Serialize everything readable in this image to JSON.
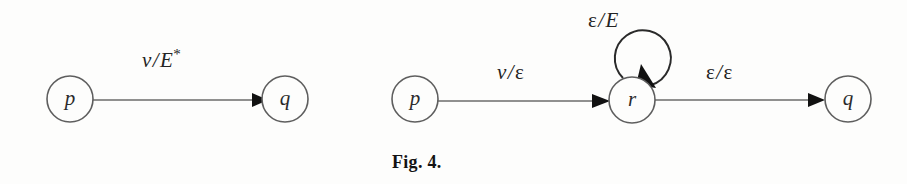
{
  "figure": {
    "caption": "Fig. 4.",
    "background_color": "#fdfdfc",
    "stroke_color": "#5e5e5e",
    "arrow_color": "#111111",
    "text_color": "#232323"
  },
  "diagrams": [
    {
      "name": "left-automaton",
      "nodes": [
        {
          "id": "p",
          "label": "p",
          "cx": 70,
          "cy": 99,
          "r": 23
        },
        {
          "id": "q",
          "label": "q",
          "cx": 285,
          "cy": 99,
          "r": 23
        }
      ],
      "edges": [
        {
          "from": "p",
          "to": "q",
          "label_input": "v",
          "label_separator": "/",
          "label_output": "E",
          "label_output_superscript": "*",
          "label_text": "v/E*",
          "label_x": 142,
          "label_y": 48
        }
      ]
    },
    {
      "name": "right-automaton",
      "nodes": [
        {
          "id": "p",
          "label": "p",
          "cx": 415,
          "cy": 99,
          "r": 23
        },
        {
          "id": "r",
          "label": "r",
          "cx": 632,
          "cy": 100,
          "r": 23
        },
        {
          "id": "q",
          "label": "q",
          "cx": 848,
          "cy": 99,
          "r": 23
        }
      ],
      "edges": [
        {
          "from": "p",
          "to": "r",
          "label_input": "v",
          "label_separator": "/",
          "label_output": "ε",
          "label_output_superscript": "",
          "label_text": "v/ε",
          "label_x": 497,
          "label_y": 60
        },
        {
          "from": "r",
          "to": "r",
          "self_loop": true,
          "label_input": "ε",
          "label_separator": "/",
          "label_output": "E",
          "label_output_superscript": "",
          "label_text": "ε/E",
          "label_x": 588,
          "label_y": 8
        },
        {
          "from": "r",
          "to": "q",
          "label_input": "ε",
          "label_separator": "/",
          "label_output": "ε",
          "label_output_superscript": "",
          "label_text": "ε/ε",
          "label_x": 706,
          "label_y": 60
        }
      ]
    }
  ]
}
